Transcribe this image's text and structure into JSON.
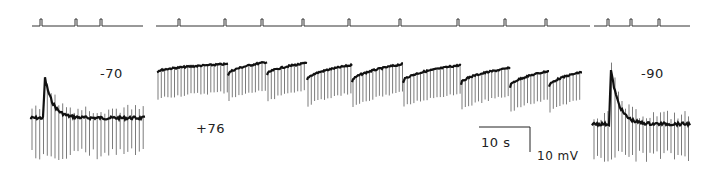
{
  "chart_data": {
    "type": "line",
    "title": "",
    "panels": [
      {
        "name": "left",
        "holding_potential_label": "-70",
        "stim_line": {
          "x0": 32,
          "x1": 143,
          "y": 26,
          "pulses_x": [
            41,
            76,
            101
          ]
        },
        "trace": {
          "x0": 30,
          "x1": 145,
          "baseline_y": 118,
          "peak": {
            "x": 45,
            "y": 78
          },
          "spike_down_y": 160,
          "spike_count": 30
        }
      },
      {
        "name": "middle",
        "holding_potential_label": "+76",
        "stim_line": {
          "x0": 156,
          "x1": 590,
          "y": 26,
          "pulses_x": [
            179,
            225,
            262,
            303,
            349,
            400,
            458,
            505,
            546
          ]
        },
        "trace": {
          "x0": 157,
          "x1": 582,
          "segments": [
            {
              "x0": 157,
              "x1": 228,
              "y_start": 72,
              "y_end": 64
            },
            {
              "x0": 228,
              "x1": 267,
              "y_start": 75,
              "y_end": 62
            },
            {
              "x0": 267,
              "x1": 307,
              "y_start": 75,
              "y_end": 63
            },
            {
              "x0": 307,
              "x1": 352,
              "y_start": 80,
              "y_end": 65
            },
            {
              "x0": 352,
              "x1": 403,
              "y_start": 82,
              "y_end": 64
            },
            {
              "x0": 403,
              "x1": 461,
              "y_start": 82,
              "y_end": 65
            },
            {
              "x0": 461,
              "x1": 510,
              "y_start": 84,
              "y_end": 68
            },
            {
              "x0": 510,
              "x1": 549,
              "y_start": 87,
              "y_end": 71
            },
            {
              "x0": 549,
              "x1": 582,
              "y_start": 87,
              "y_end": 72
            }
          ],
          "spike_depth": 28,
          "spike_spacing": 3.3
        }
      },
      {
        "name": "right",
        "holding_potential_label": "-90",
        "stim_line": {
          "x0": 594,
          "x1": 690,
          "y": 26,
          "pulses_x": [
            608,
            631,
            659
          ]
        },
        "trace": {
          "x0": 592,
          "x1": 690,
          "baseline_y": 124,
          "peak": {
            "x": 611,
            "y": 70
          },
          "spike_down_y": 162,
          "spike_count": 28
        }
      }
    ],
    "scale_bar": {
      "time_label": "10 s",
      "voltage_label": "10 mV",
      "x0": 479,
      "x1": 530,
      "y_top": 127,
      "y_bottom": 152
    },
    "xlabel": "",
    "ylabel": "",
    "grid": false,
    "legend": null
  },
  "labels": {
    "left_potential": "-70",
    "middle_potential": "+76",
    "right_potential": "-90",
    "time_scale": "10 s",
    "voltage_scale": "10 mV"
  }
}
